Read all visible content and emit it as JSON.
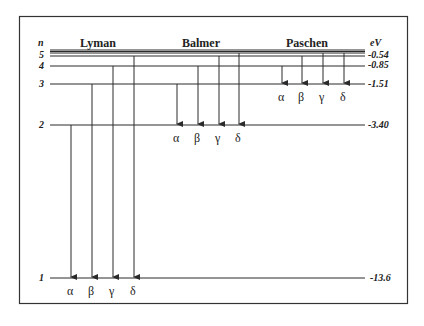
{
  "axis": {
    "n_label": "n",
    "energy_unit": "eV"
  },
  "levels": [
    {
      "n": "1",
      "energy": "-13.6",
      "y": 278
    },
    {
      "n": "2",
      "energy": "-3.40",
      "y": 125
    },
    {
      "n": "3",
      "energy": "-1.51",
      "y": 84
    },
    {
      "n": "4",
      "energy": "-0.85",
      "y": 66
    },
    {
      "n": "5",
      "energy": "-0.54",
      "y": 56
    }
  ],
  "series": [
    {
      "name": "Lyman",
      "target_level": "1",
      "lines": [
        "α",
        "β",
        "γ",
        "δ"
      ]
    },
    {
      "name": "Balmer",
      "target_level": "2",
      "lines": [
        "α",
        "β",
        "γ",
        "δ"
      ]
    },
    {
      "name": "Paschen",
      "target_level": "3",
      "lines": [
        "α",
        "β",
        "γ",
        "δ"
      ]
    }
  ],
  "colors": {
    "line": "#2a2a2a",
    "frame": "#333333",
    "text": "#222222"
  }
}
